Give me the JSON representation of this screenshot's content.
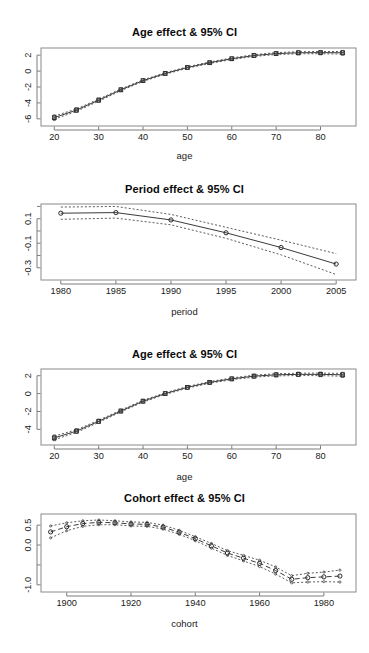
{
  "page": {
    "background": "#ffffff",
    "width": 369,
    "height": 653,
    "figure_kind": "R base-graphics multi-panel APC effect plot"
  },
  "panels": [
    {
      "id": "age-effect-top",
      "title": "Age effect & 95% CI",
      "xlabel": "age",
      "ylabel": ""
    },
    {
      "id": "period-effect",
      "title": "Period effect & 95% CI",
      "xlabel": "period",
      "ylabel": ""
    },
    {
      "id": "age-effect-bottom",
      "title": "Age effect & 95% CI",
      "xlabel": "age",
      "ylabel": ""
    },
    {
      "id": "cohort-effect",
      "title": "Cohort effect & 95% CI",
      "xlabel": "cohort",
      "ylabel": ""
    }
  ],
  "chart_data": [
    {
      "type": "line",
      "id": "age-effect-top",
      "title": "Age effect & 95% CI",
      "xlabel": "age",
      "ylabel": "",
      "xlim": [
        17,
        88
      ],
      "ylim": [
        -6.9,
        2.9
      ],
      "xticks": [
        20,
        30,
        40,
        50,
        60,
        70,
        80
      ],
      "yticks": [
        -6,
        -4,
        -2,
        0,
        2
      ],
      "grid": false,
      "legend": null,
      "marker": "open-square",
      "line_style": "solid-with-dotted-ci",
      "x": [
        20,
        25,
        30,
        35,
        40,
        45,
        50,
        55,
        60,
        65,
        70,
        75,
        80,
        85
      ],
      "series": [
        {
          "name": "Age effect (fitted)",
          "values": [
            -5.85,
            -4.9,
            -3.65,
            -2.35,
            -1.2,
            -0.3,
            0.45,
            1.05,
            1.55,
            1.95,
            2.2,
            2.3,
            2.32,
            2.3
          ]
        },
        {
          "name": "Lower 95% CI",
          "values": [
            -6.05,
            -5.05,
            -3.78,
            -2.46,
            -1.3,
            -0.39,
            0.36,
            0.96,
            1.45,
            1.84,
            2.08,
            2.17,
            2.18,
            2.14
          ]
        },
        {
          "name": "Upper 95% CI",
          "values": [
            -5.65,
            -4.75,
            -3.52,
            -2.24,
            -1.1,
            -0.21,
            0.54,
            1.14,
            1.65,
            2.06,
            2.32,
            2.43,
            2.46,
            2.46
          ]
        }
      ]
    },
    {
      "type": "line",
      "id": "period-effect",
      "title": "Period effect & 95% CI",
      "xlabel": "period",
      "ylabel": "",
      "xlim": [
        1978.2,
        2006.8
      ],
      "ylim": [
        -0.4,
        0.22
      ],
      "xticks": [
        1980,
        1985,
        1990,
        1995,
        2000,
        2005
      ],
      "yticks": [
        0.1,
        -0.1,
        -0.3
      ],
      "grid": false,
      "legend": null,
      "marker": "open-circle",
      "line_style": "solid-with-dotted-ci",
      "x": [
        1980,
        1985,
        1990,
        1995,
        2000,
        2005
      ],
      "series": [
        {
          "name": "Period effect (fitted)",
          "values": [
            0.145,
            0.15,
            0.09,
            -0.015,
            -0.135,
            -0.27
          ]
        },
        {
          "name": "Lower 95% CI",
          "values": [
            0.095,
            0.105,
            0.05,
            -0.06,
            -0.195,
            -0.355
          ]
        },
        {
          "name": "Upper 95% CI",
          "values": [
            0.195,
            0.2,
            0.135,
            0.03,
            -0.075,
            -0.185
          ]
        }
      ]
    },
    {
      "type": "line",
      "id": "age-effect-bottom",
      "title": "Age effect & 95% CI",
      "xlabel": "age",
      "ylabel": "",
      "xlim": [
        17,
        88
      ],
      "ylim": [
        -5.75,
        2.75
      ],
      "xticks": [
        20,
        30,
        40,
        50,
        60,
        70,
        80
      ],
      "yticks": [
        -4,
        -2,
        0,
        2
      ],
      "grid": false,
      "legend": null,
      "marker": "open-square",
      "line_style": "solid-with-dotted-ci",
      "x": [
        20,
        25,
        30,
        35,
        40,
        45,
        50,
        55,
        60,
        65,
        70,
        75,
        80,
        85
      ],
      "series": [
        {
          "name": "Age effect (fitted)",
          "values": [
            -4.95,
            -4.2,
            -3.1,
            -1.95,
            -0.85,
            0.0,
            0.7,
            1.25,
            1.65,
            1.95,
            2.1,
            2.15,
            2.15,
            2.1
          ]
        },
        {
          "name": "Lower 95% CI",
          "values": [
            -5.15,
            -4.35,
            -3.22,
            -2.05,
            -0.95,
            -0.09,
            0.61,
            1.16,
            1.55,
            1.84,
            1.98,
            2.02,
            2.01,
            1.94
          ]
        },
        {
          "name": "Upper 95% CI",
          "values": [
            -4.75,
            -4.05,
            -2.98,
            -1.85,
            -0.75,
            0.09,
            0.79,
            1.34,
            1.75,
            2.06,
            2.22,
            2.28,
            2.29,
            2.26
          ]
        }
      ]
    },
    {
      "type": "line",
      "id": "cohort-effect",
      "title": "Cohort effect & 95% CI",
      "xlabel": "cohort",
      "ylabel": "",
      "xlim": [
        1892,
        1990
      ],
      "ylim": [
        -1.18,
        0.78
      ],
      "xticks": [
        1900,
        1920,
        1940,
        1960,
        1980
      ],
      "yticks": [
        0.5,
        0.0,
        -1.0
      ],
      "grid": false,
      "legend": null,
      "marker": "open-circle",
      "line_style": "dashed-with-dotted-ci",
      "x": [
        1895,
        1900,
        1905,
        1910,
        1915,
        1920,
        1925,
        1930,
        1935,
        1940,
        1945,
        1950,
        1955,
        1960,
        1965,
        1970,
        1975,
        1980,
        1985
      ],
      "series": [
        {
          "name": "Cohort effect (fitted)",
          "values": [
            0.33,
            0.46,
            0.54,
            0.57,
            0.56,
            0.53,
            0.52,
            0.45,
            0.32,
            0.16,
            -0.02,
            -0.2,
            -0.33,
            -0.46,
            -0.64,
            -0.86,
            -0.82,
            -0.8,
            -0.78
          ]
        },
        {
          "name": "Lower 95% CI",
          "values": [
            0.18,
            0.36,
            0.47,
            0.51,
            0.51,
            0.48,
            0.47,
            0.4,
            0.27,
            0.11,
            -0.08,
            -0.26,
            -0.4,
            -0.54,
            -0.73,
            -0.95,
            -0.93,
            -0.92,
            -0.93
          ]
        },
        {
          "name": "Upper 95% CI",
          "values": [
            0.48,
            0.56,
            0.61,
            0.63,
            0.61,
            0.58,
            0.57,
            0.5,
            0.37,
            0.21,
            0.04,
            -0.14,
            -0.26,
            -0.38,
            -0.55,
            -0.77,
            -0.71,
            -0.68,
            -0.63
          ]
        }
      ]
    }
  ]
}
